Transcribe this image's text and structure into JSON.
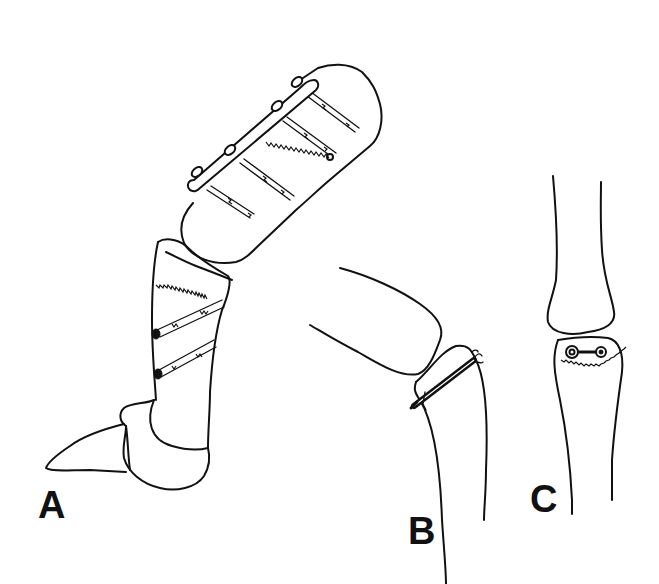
{
  "figure": {
    "background_color": "#ffffff",
    "line_color": "#111111",
    "panels": [
      {
        "id": "A",
        "label": "A",
        "content": "Finger in flexion: proximal phalanx fixed with dorsal plate and four screws; middle segment fixed with two lag screws across oblique fracture; distal phalanx below"
      },
      {
        "id": "B",
        "label": "B",
        "content": "Lateral view of joint with single transverse screw/wire through base fragment"
      },
      {
        "id": "C",
        "label": "C",
        "content": "AP view of joint with transverse screw across base fracture (jagged fracture line)"
      }
    ]
  }
}
